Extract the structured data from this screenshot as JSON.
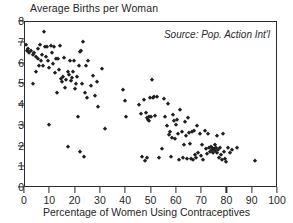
{
  "chart_data": {
    "type": "scatter",
    "title": "Average Births per Woman",
    "xlabel": "Percentage of Women Using Contraceptives",
    "ylabel": "Average Births per Woman",
    "annotation": "Source: Pop. Action Int'l",
    "xlim": [
      0,
      100
    ],
    "ylim": [
      0,
      8
    ],
    "xticks": [
      0,
      10,
      20,
      30,
      40,
      50,
      60,
      70,
      80,
      90,
      100
    ],
    "yticks": [
      0,
      1,
      2,
      3,
      4,
      5,
      6,
      7,
      8
    ],
    "xtick_labels": [
      "0",
      "10",
      "20",
      "30",
      "40",
      "50",
      "60",
      "70",
      "80",
      "90",
      "100"
    ],
    "ytick_labels": [
      "0",
      "1",
      "2",
      "3",
      "4",
      "5",
      "6",
      "7",
      "8"
    ],
    "grid": false,
    "legend": false,
    "marker": "diamond",
    "marker_color": "#1f1f1f",
    "series": [
      {
        "name": "Countries",
        "points": [
          [
            0.4,
            6.9
          ],
          [
            0.6,
            6.6
          ],
          [
            1.2,
            6.7
          ],
          [
            1.6,
            6.5
          ],
          [
            2.4,
            6.6
          ],
          [
            3.0,
            6.4
          ],
          [
            3.2,
            5.0
          ],
          [
            3.6,
            6.5
          ],
          [
            4.2,
            6.3
          ],
          [
            4.4,
            5.6
          ],
          [
            5.0,
            6.2
          ],
          [
            5.2,
            6.7
          ],
          [
            5.6,
            5.9
          ],
          [
            6.0,
            6.9
          ],
          [
            6.2,
            6.1
          ],
          [
            6.6,
            6.4
          ],
          [
            7.0,
            5.9
          ],
          [
            7.4,
            7.5
          ],
          [
            7.8,
            6.8
          ],
          [
            8.2,
            6.3
          ],
          [
            8.6,
            6.8
          ],
          [
            9.0,
            6.1
          ],
          [
            9.4,
            5.8
          ],
          [
            9.6,
            3.05
          ],
          [
            10.2,
            6.85
          ],
          [
            10.6,
            6.5
          ],
          [
            11.0,
            6.0
          ],
          [
            11.6,
            6.8
          ],
          [
            12.0,
            5.55
          ],
          [
            12.4,
            6.2
          ],
          [
            12.8,
            4.6
          ],
          [
            13.2,
            6.2
          ],
          [
            13.6,
            5.7
          ],
          [
            14.0,
            6.85
          ],
          [
            14.4,
            5.25
          ],
          [
            14.8,
            5.1
          ],
          [
            15.2,
            5.35
          ],
          [
            15.6,
            6.25
          ],
          [
            16.0,
            4.8
          ],
          [
            16.4,
            5.2
          ],
          [
            16.8,
            5.6
          ],
          [
            17.0,
            1.98
          ],
          [
            17.4,
            5.45
          ],
          [
            17.8,
            6.1
          ],
          [
            18.2,
            5.15
          ],
          [
            18.4,
            5.3
          ],
          [
            18.8,
            5.6
          ],
          [
            19.2,
            6.1
          ],
          [
            19.6,
            4.75
          ],
          [
            20.0,
            5.0
          ],
          [
            20.4,
            5.35
          ],
          [
            20.8,
            3.4
          ],
          [
            21.2,
            5.9
          ],
          [
            21.6,
            6.55
          ],
          [
            21.8,
            1.75
          ],
          [
            22.2,
            6.6
          ],
          [
            22.6,
            5.0
          ],
          [
            23.0,
            7.05
          ],
          [
            23.2,
            1.5
          ],
          [
            23.6,
            4.6
          ],
          [
            24.0,
            5.9
          ],
          [
            24.4,
            4.35
          ],
          [
            25.0,
            6.1
          ],
          [
            26.0,
            4.9
          ],
          [
            27.0,
            5.4
          ],
          [
            27.6,
            4.45
          ],
          [
            28.4,
            5.1
          ],
          [
            29.0,
            3.9
          ],
          [
            30.4,
            5.75
          ],
          [
            31.6,
            2.82
          ],
          [
            38.6,
            4.7
          ],
          [
            39.4,
            4.2
          ],
          [
            39.8,
            3.4
          ],
          [
            45.0,
            4.0
          ],
          [
            46.0,
            3.55
          ],
          [
            46.4,
            1.5
          ],
          [
            47.0,
            4.25
          ],
          [
            47.4,
            1.3
          ],
          [
            47.8,
            3.6
          ],
          [
            48.2,
            3.35
          ],
          [
            48.4,
            1.45
          ],
          [
            48.8,
            3.3
          ],
          [
            49.0,
            3.25
          ],
          [
            49.2,
            3.4
          ],
          [
            49.6,
            4.35
          ],
          [
            49.8,
            3.4
          ],
          [
            50.0,
            5.2
          ],
          [
            50.4,
            4.35
          ],
          [
            50.8,
            4.4
          ],
          [
            51.2,
            3.45
          ],
          [
            52.0,
            4.4
          ],
          [
            53.0,
            1.45
          ],
          [
            54.0,
            1.9
          ],
          [
            55.0,
            4.3
          ],
          [
            55.4,
            3.4
          ],
          [
            56.0,
            3.0
          ],
          [
            56.6,
            4.05
          ],
          [
            57.0,
            2.55
          ],
          [
            57.4,
            2.7
          ],
          [
            57.8,
            1.5
          ],
          [
            58.2,
            2.4
          ],
          [
            58.6,
            3.5
          ],
          [
            59.0,
            3.25
          ],
          [
            59.4,
            2.35
          ],
          [
            59.8,
            3.05
          ],
          [
            60.2,
            3.3
          ],
          [
            60.6,
            2.6
          ],
          [
            61.0,
            1.35
          ],
          [
            61.4,
            3.75
          ],
          [
            62.0,
            2.7
          ],
          [
            62.4,
            1.45
          ],
          [
            62.8,
            2.05
          ],
          [
            63.2,
            3.2
          ],
          [
            63.6,
            2.5
          ],
          [
            64.0,
            1.4
          ],
          [
            64.4,
            3.35
          ],
          [
            64.8,
            2.65
          ],
          [
            65.2,
            2.1
          ],
          [
            65.6,
            1.4
          ],
          [
            66.0,
            2.7
          ],
          [
            66.4,
            1.35
          ],
          [
            66.8,
            2.75
          ],
          [
            67.2,
            1.6
          ],
          [
            67.6,
            1.45
          ],
          [
            68.0,
            3.0
          ],
          [
            68.4,
            1.7
          ],
          [
            69.0,
            2.6
          ],
          [
            69.4,
            1.55
          ],
          [
            70.0,
            2.05
          ],
          [
            70.4,
            1.35
          ],
          [
            71.0,
            2.75
          ],
          [
            71.4,
            1.9
          ],
          [
            71.8,
            1.65
          ],
          [
            72.2,
            2.6
          ],
          [
            72.6,
            1.95
          ],
          [
            73.0,
            1.75
          ],
          [
            73.4,
            2.0
          ],
          [
            73.8,
            1.85
          ],
          [
            74.0,
            1.95
          ],
          [
            74.4,
            1.7
          ],
          [
            74.8,
            1.9
          ],
          [
            75.0,
            2.05
          ],
          [
            75.2,
            1.8
          ],
          [
            75.6,
            1.95
          ],
          [
            75.8,
            1.7
          ],
          [
            76.0,
            2.5
          ],
          [
            76.4,
            1.85
          ],
          [
            76.8,
            1.45
          ],
          [
            77.0,
            1.95
          ],
          [
            77.4,
            1.6
          ],
          [
            77.8,
            1.35
          ],
          [
            78.2,
            2.6
          ],
          [
            78.6,
            1.75
          ],
          [
            79.0,
            1.4
          ],
          [
            79.6,
            1.25
          ],
          [
            80.4,
            1.95
          ],
          [
            81.0,
            1.7
          ],
          [
            82.0,
            1.85
          ],
          [
            83.6,
            1.95
          ],
          [
            90.8,
            1.3
          ]
        ]
      }
    ]
  }
}
